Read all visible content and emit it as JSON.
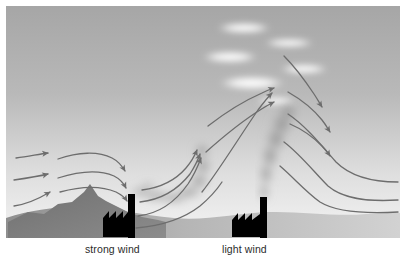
{
  "figure": {
    "type": "diagram",
    "width": 410,
    "height": 268,
    "background": "#ffffff"
  },
  "labels": {
    "strong_wind": "strong wind",
    "light_wind": "light wind",
    "color": "#2b2b2b"
  },
  "scene": {
    "sky": {
      "top_color": "#a8a8a8",
      "bottom_color": "#f2f2f2",
      "description": "vertical grey gradient sky, darker at top"
    },
    "ground": {
      "color_left": "#9a9a9a",
      "color_right": "#cfcfcf",
      "description": "low rolling terrain silhouette along the base"
    },
    "mountain": {
      "name": "peaked-hill",
      "fill": "#7a7a7a",
      "peak_x": 83,
      "peak_y": 186
    },
    "clouds": {
      "color": "#ffffff",
      "count": 6,
      "description": "flattened lenticular white clouds in the upper right sky",
      "items": [
        {
          "cx": 238,
          "cy": 22,
          "rx": 26,
          "ry": 5
        },
        {
          "cx": 281,
          "cy": 36,
          "rx": 24,
          "ry": 4
        },
        {
          "cx": 225,
          "cy": 50,
          "rx": 27,
          "ry": 6
        },
        {
          "cx": 296,
          "cy": 62,
          "rx": 23,
          "ry": 5
        },
        {
          "cx": 244,
          "cy": 76,
          "rx": 31,
          "ry": 7
        },
        {
          "cx": 268,
          "cy": 94,
          "rx": 20,
          "ry": 4
        }
      ]
    },
    "factories": [
      {
        "name": "factory-left",
        "label_ref": "strong_wind",
        "fill": "#000000",
        "chimney": {
          "x": 122,
          "y": 189,
          "w": 7,
          "h": 42
        },
        "shed": {
          "x": 97,
          "y": 205,
          "w": 26,
          "h": 26,
          "teeth": 3
        },
        "plume": {
          "style": "horizontal-looping",
          "color": "#b4b4b4",
          "description": "smoke bends sharply downwind and loops near the ground"
        }
      },
      {
        "name": "factory-right",
        "label_ref": "light_wind",
        "fill": "#000000",
        "chimney": {
          "x": 254,
          "y": 192,
          "w": 7,
          "h": 38
        },
        "shed": {
          "x": 228,
          "y": 208,
          "w": 26,
          "h": 22,
          "teeth": 3
        },
        "plume": {
          "style": "vertical-coning",
          "color": "#a0a0a0",
          "description": "smoke rises almost vertically and fans out aloft"
        }
      }
    ],
    "flow": {
      "stroke": "#6d6d6d",
      "stroke_width": 1.3,
      "arrowhead": "solid triangular head",
      "groups": [
        {
          "name": "inflow-arrows-left",
          "count": 3,
          "direction": "right",
          "has_head": true
        },
        {
          "name": "over-mountain-arrows",
          "count": 3,
          "direction": "down-right",
          "has_head": true
        },
        {
          "name": "updraft-arrows",
          "count": 3,
          "direction": "up-right",
          "has_head": true
        },
        {
          "name": "crest-arrows",
          "count": 3,
          "direction": "right",
          "has_head": true
        },
        {
          "name": "descent-arrows",
          "count": 3,
          "direction": "down-right",
          "has_head": true
        },
        {
          "name": "trailing-streamlines-right",
          "count": 3,
          "direction": "right",
          "has_head": false
        }
      ]
    }
  }
}
